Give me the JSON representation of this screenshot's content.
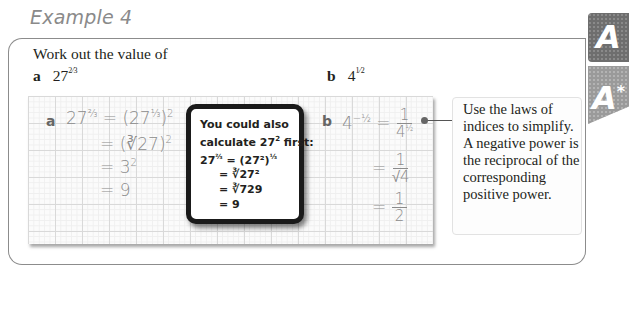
{
  "title": "Example 4",
  "question": {
    "prompt": "Work out the value of",
    "part_a": {
      "label": "a",
      "base": "27",
      "exponent": "2/3",
      "exp_num": "2",
      "exp_den": "3"
    },
    "part_b": {
      "label": "b",
      "base": "4",
      "exponent": "-1/2",
      "exp_num": "1",
      "exp_den": "2"
    }
  },
  "solution_a": {
    "label": "a",
    "lines": [
      "27^(2/3) = (27^(1/3))^2",
      "= (∛27)^2",
      "= 3^2",
      "= 9"
    ],
    "l1_lhs": "27",
    "l1_rhs_base": "27",
    "l1_outer_exp": "2",
    "l2": "= (∛27)",
    "l2_exp": "2",
    "l3": "= 3",
    "l3_exp": "2",
    "l4": "= 9"
  },
  "callout": {
    "line1": "You could also",
    "line2": "calculate 27",
    "line2_exp": "2",
    "line2_end": " first:",
    "line3_lhs": "27",
    "line3_rhs": "= (27²)",
    "line4": "= ∛27²",
    "line5": "= ∛729",
    "line6": "= 9"
  },
  "solution_b": {
    "label": "b",
    "lhs_base": "4",
    "lines": [
      "4^(-1/2) = 1/4^(1/2)",
      "= 1/√4",
      "= 1/2"
    ],
    "f1_num": "1",
    "f1_den": "4",
    "f2_num": "1",
    "f2_den": "√4",
    "f3_num": "1",
    "f3_den": "2",
    "eq": "="
  },
  "note": {
    "text": "Use the laws of indices to simplify. A negative power is the reciprocal of the corresponding positive power."
  },
  "badges": [
    {
      "label": "A"
    },
    {
      "label": "A",
      "suffix": "*"
    }
  ]
}
